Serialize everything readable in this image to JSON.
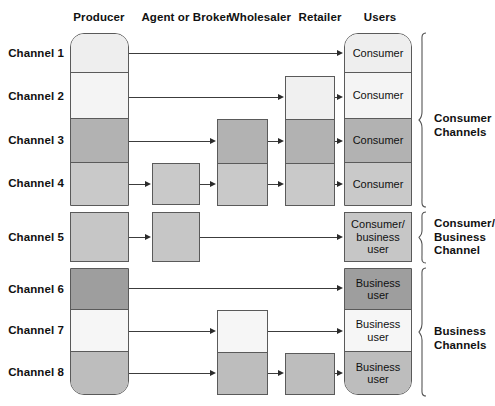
{
  "diagram": {
    "column_headers": [
      {
        "id": "producer",
        "label": "Producer"
      },
      {
        "id": "agent",
        "label": "Agent or Broker"
      },
      {
        "id": "wholesaler",
        "label": "Wholesaler"
      },
      {
        "id": "retailer",
        "label": "Retailer"
      },
      {
        "id": "users",
        "label": "Users"
      }
    ],
    "channel_labels": [
      {
        "id": "ch1",
        "label": "Channel 1"
      },
      {
        "id": "ch2",
        "label": "Channel 2"
      },
      {
        "id": "ch3",
        "label": "Channel 3"
      },
      {
        "id": "ch4",
        "label": "Channel 4"
      },
      {
        "id": "ch5",
        "label": "Channel 5"
      },
      {
        "id": "ch6",
        "label": "Channel 6"
      },
      {
        "id": "ch7",
        "label": "Channel 7"
      },
      {
        "id": "ch8",
        "label": "Channel 8"
      }
    ],
    "producer_cells": [
      {
        "channel": "Channel 1",
        "fill": "#eeeeee"
      },
      {
        "channel": "Channel 2",
        "fill": "#f4f4f4"
      },
      {
        "channel": "Channel 3",
        "fill": "#b2b2b2"
      },
      {
        "channel": "Channel 4",
        "fill": "#c9c9c9"
      },
      {
        "channel": "Channel 5",
        "fill": "#c6c6c6"
      },
      {
        "channel": "Channel 6",
        "fill": "#9e9e9e"
      },
      {
        "channel": "Channel 7",
        "fill": "#f6f6f6"
      },
      {
        "channel": "Channel 8",
        "fill": "#bdbdbd"
      }
    ],
    "agent_cells": [
      {
        "channel": "Channel 4",
        "fill": "#c9c9c9"
      },
      {
        "channel": "Channel 5",
        "fill": "#c6c6c6"
      }
    ],
    "wholesaler_cells": [
      {
        "channel": "Channel 3",
        "fill": "#b2b2b2"
      },
      {
        "channel": "Channel 4",
        "fill": "#c9c9c9"
      },
      {
        "channel": "Channel 7",
        "fill": "#f6f6f6"
      },
      {
        "channel": "Channel 8",
        "fill": "#bdbdbd"
      }
    ],
    "retailer_cells": [
      {
        "channel": "Channel 2",
        "fill": "#f0f0f0"
      },
      {
        "channel": "Channel 3",
        "fill": "#b2b2b2"
      },
      {
        "channel": "Channel 4",
        "fill": "#c9c9c9"
      },
      {
        "channel": "Channel 8",
        "fill": "#bdbdbd"
      }
    ],
    "user_cells": [
      {
        "channel": "Channel 1",
        "label": "Consumer",
        "fill": "#eeeeee"
      },
      {
        "channel": "Channel 2",
        "label": "Consumer",
        "fill": "#f4f4f4"
      },
      {
        "channel": "Channel 3",
        "label": "Consumer",
        "fill": "#b2b2b2"
      },
      {
        "channel": "Channel 4",
        "label": "Consumer",
        "fill": "#c9c9c9"
      },
      {
        "channel": "Channel 5",
        "label": "Consumer/ business user",
        "fill": "#c6c6c6"
      },
      {
        "channel": "Channel 6",
        "label": "Business user",
        "fill": "#9e9e9e"
      },
      {
        "channel": "Channel 7",
        "label": "Business user",
        "fill": "#f6f6f6"
      },
      {
        "channel": "Channel 8",
        "label": "Business user",
        "fill": "#bdbdbd"
      }
    ],
    "user_labels": {
      "consumer": "Consumer",
      "consumer_business_line1": "Consumer/",
      "consumer_business_line2": "business",
      "consumer_business_line3": "user",
      "business_line1": "Business",
      "business_line2": "user"
    },
    "group_brackets": [
      {
        "id": "consumer-channels",
        "line1": "Consumer",
        "line2": "Channels",
        "line3": "",
        "channels": "Channel 1-4"
      },
      {
        "id": "consumer-business-channel",
        "line1": "Consumer/",
        "line2": "Business",
        "line3": "Channel",
        "channels": "Channel 5"
      },
      {
        "id": "business-channels",
        "line1": "Business",
        "line2": "Channels",
        "line3": "",
        "channels": "Channel 6-8"
      }
    ],
    "colors": {
      "border": "#5a5a5a",
      "arrow": "#2b2b2b",
      "text": "#111111",
      "background": "#ffffff"
    }
  }
}
